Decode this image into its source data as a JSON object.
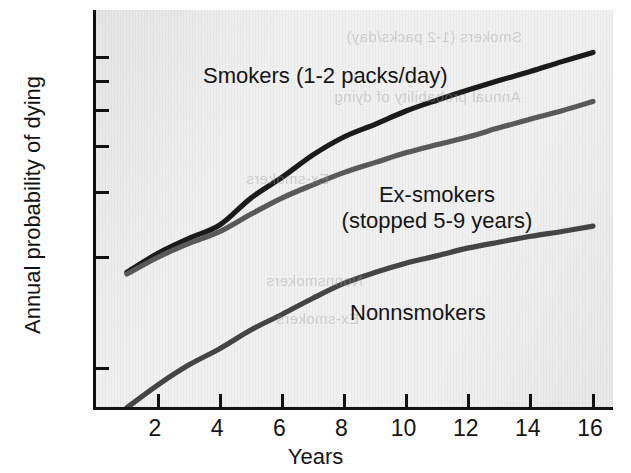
{
  "chart_data": {
    "type": "line",
    "title": "",
    "xlabel": "Years",
    "ylabel": "Annual probability of dying",
    "yscale": "log",
    "xlim": [
      1,
      16
    ],
    "ylim": [
      0.7,
      7.6
    ],
    "grid": false,
    "legend_position": "inline-annotations",
    "x_tick_labels": [
      "2",
      "4",
      "6",
      "8",
      "10",
      "12",
      "14",
      "16"
    ],
    "x_tick_values": [
      2,
      4,
      6,
      8,
      10,
      12,
      14,
      16
    ],
    "y_tick_labels": [
      "7.0",
      "6.0",
      "5.0",
      "4.0",
      "3.0",
      "2.0",
      "1.0"
    ],
    "y_tick_values": [
      7.0,
      6.0,
      5.0,
      4.0,
      3.0,
      2.0,
      1.0
    ],
    "x": [
      1,
      2,
      3,
      4,
      5,
      6,
      7,
      8,
      9,
      10,
      11,
      12,
      13,
      14,
      15,
      16
    ],
    "series": [
      {
        "name": "Smokers (1-2 packs/day)",
        "color": "#1b1b1b",
        "values": [
          1.82,
          2.05,
          2.25,
          2.45,
          2.9,
          3.3,
          3.8,
          4.25,
          4.6,
          5.0,
          5.35,
          5.7,
          6.05,
          6.4,
          6.8,
          7.2
        ]
      },
      {
        "name": "Ex-smokers (stopped 5-9 years)",
        "color": "#5a5a5a",
        "values": [
          1.8,
          2.0,
          2.18,
          2.35,
          2.62,
          2.9,
          3.15,
          3.4,
          3.62,
          3.85,
          4.05,
          4.25,
          4.5,
          4.75,
          5.0,
          5.3
        ]
      },
      {
        "name": "Nonnsmokers",
        "color": "#454545",
        "values": [
          0.78,
          0.9,
          1.02,
          1.13,
          1.27,
          1.4,
          1.55,
          1.7,
          1.82,
          1.93,
          2.02,
          2.12,
          2.2,
          2.28,
          2.35,
          2.43
        ]
      }
    ]
  },
  "axes": {
    "y_title": "Annual probability of dying",
    "x_title": "Years",
    "y_ticks": [
      {
        "label": "7.0",
        "value": 7.0
      },
      {
        "label": "6.0",
        "value": 6.0
      },
      {
        "label": "5.0",
        "value": 5.0
      },
      {
        "label": "4.0",
        "value": 4.0
      },
      {
        "label": "3.0",
        "value": 3.0
      },
      {
        "label": "2.0",
        "value": 2.0
      },
      {
        "label": "1.0",
        "value": 1.0
      }
    ],
    "x_ticks": [
      {
        "label": "2",
        "value": 2
      },
      {
        "label": "4",
        "value": 4
      },
      {
        "label": "6",
        "value": 6
      },
      {
        "label": "8",
        "value": 8
      },
      {
        "label": "10",
        "value": 10
      },
      {
        "label": "12",
        "value": 12
      },
      {
        "label": "14",
        "value": 14
      },
      {
        "label": "16",
        "value": 16
      }
    ]
  },
  "annotations": {
    "smokers": "Smokers (1-2 packs/day)",
    "exsmokers_line1": "Ex-smokers",
    "exsmokers_line2": "(stopped 5-9 years)",
    "nonsmokers": "Nonnsmokers"
  },
  "ghost_text": {
    "line1": "Smokers (1-2 packs/day)",
    "line2": "Annual probability of dying",
    "line3": "Ex-smokers",
    "line4": "Nonnsmokers"
  },
  "colors": {
    "plot_background": "#f1f1f1",
    "axis": "#111111",
    "smokers": "#1b1b1b",
    "exsmokers": "#5a5a5a",
    "nonsmokers": "#454545"
  }
}
